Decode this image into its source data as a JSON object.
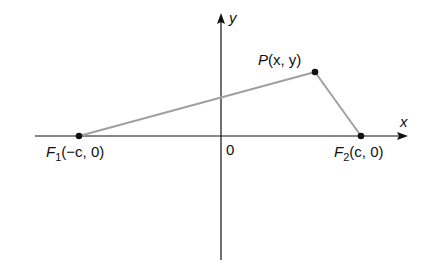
{
  "diagram": {
    "axes": {
      "x_label": "x",
      "y_label": "y",
      "origin_label": "0"
    },
    "points": {
      "P": {
        "name": "P",
        "args": "(x, y)",
        "px": [
          315,
          72
        ]
      },
      "F1": {
        "name": "F",
        "sub": "1",
        "args": "(−c, 0)",
        "px": [
          79,
          136
        ]
      },
      "F2": {
        "name": "F",
        "sub": "2",
        "args": "(c, 0)",
        "px": [
          361,
          136
        ]
      }
    },
    "colors": {
      "axis": "#111111",
      "segment": "#a0a0a0",
      "point": "#111111"
    }
  }
}
